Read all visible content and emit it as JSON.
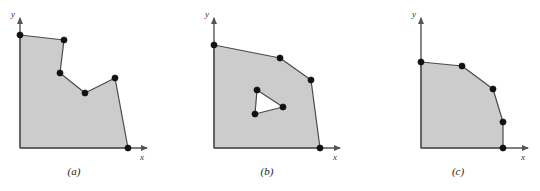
{
  "figure": {
    "background_color": "#ffffff",
    "fill_color": "#cccccc",
    "edge_color": "#4a4a4a",
    "vertex_color": "#111111",
    "axis_color": "#555555"
  },
  "chart_data": {
    "type": "diagram",
    "title": "",
    "xlabel": "x",
    "ylabel": "y",
    "grid": false,
    "legend": null,
    "panels": [
      {
        "id": "a",
        "caption": "(a)",
        "caption_pos": [
          74,
          175
        ],
        "axis": {
          "origin": [
            20,
            148
          ],
          "x_axis_end": [
            147,
            148
          ],
          "y_axis_end": [
            20,
            18
          ],
          "x_label": "x",
          "x_label_pos": [
            140,
            160
          ],
          "y_label": "y",
          "y_label_pos": [
            11,
            17
          ]
        },
        "outline": [
          [
            20,
            148
          ],
          [
            20,
            35
          ],
          [
            64,
            40
          ],
          [
            60,
            73
          ],
          [
            85,
            93
          ],
          [
            115,
            78
          ],
          [
            128,
            148
          ]
        ],
        "vertices": [
          [
            20,
            35
          ],
          [
            64,
            40
          ],
          [
            60,
            73
          ],
          [
            85,
            93
          ],
          [
            115,
            78
          ],
          [
            128,
            148
          ]
        ],
        "holes": []
      },
      {
        "id": "b",
        "caption": "(b)",
        "caption_pos": [
          267,
          175
        ],
        "axis": {
          "origin": [
            214,
            148
          ],
          "x_axis_end": [
            340,
            148
          ],
          "y_axis_end": [
            214,
            18
          ],
          "x_label": "x",
          "x_label_pos": [
            333,
            160
          ],
          "y_label": "y",
          "y_label_pos": [
            205,
            17
          ]
        },
        "outline": [
          [
            214,
            148
          ],
          [
            214,
            45
          ],
          [
            280,
            58
          ],
          [
            311,
            80
          ],
          [
            320,
            148
          ]
        ],
        "vertices": [
          [
            214,
            45
          ],
          [
            280,
            58
          ],
          [
            311,
            80
          ],
          [
            320,
            148
          ]
        ],
        "holes": [
          {
            "outline": [
              [
                257,
                90
              ],
              [
                283,
                107
              ],
              [
                255,
                114
              ]
            ],
            "vertices": [
              [
                257,
                90
              ],
              [
                283,
                107
              ],
              [
                255,
                114
              ]
            ]
          }
        ]
      },
      {
        "id": "c",
        "caption": "(c)",
        "caption_pos": [
          458,
          175
        ],
        "axis": {
          "origin": [
            421,
            148
          ],
          "x_axis_end": [
            528,
            148
          ],
          "y_axis_end": [
            421,
            18
          ],
          "x_label": "x",
          "x_label_pos": [
            521,
            160
          ],
          "y_label": "y",
          "y_label_pos": [
            412,
            17
          ]
        },
        "outline": [
          [
            421,
            148
          ],
          [
            421,
            62
          ],
          [
            462,
            66
          ],
          [
            493,
            89
          ],
          [
            503,
            122
          ],
          [
            503,
            148
          ]
        ],
        "vertices": [
          [
            421,
            62
          ],
          [
            462,
            66
          ],
          [
            493,
            89
          ],
          [
            503,
            122
          ],
          [
            503,
            148
          ]
        ],
        "holes": []
      }
    ]
  }
}
